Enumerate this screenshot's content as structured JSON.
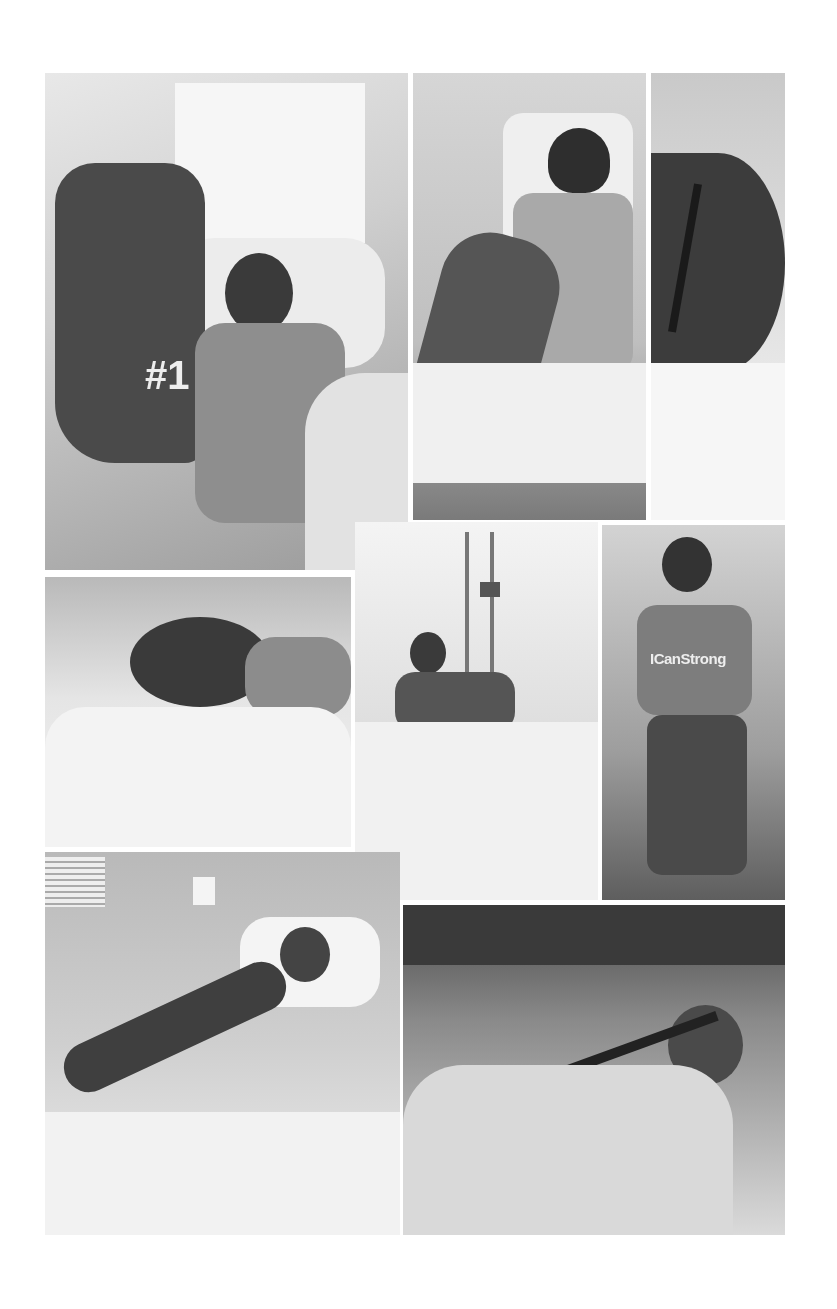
{
  "collage": {
    "description": "Grayscale collage of eight hospital photos",
    "panels": [
      {
        "id": "p1",
        "subject": "patient in hospital bed holding foam finger",
        "text": "#1"
      },
      {
        "id": "p2",
        "subject": "patient sitting in bed wearing helmet"
      },
      {
        "id": "p3",
        "subject": "close-up of head with surgical scar"
      },
      {
        "id": "p4",
        "subject": "patient lying with face on pillow"
      },
      {
        "id": "p5",
        "subject": "patient in hospital bed with IV poles"
      },
      {
        "id": "p6",
        "subject": "patient in wheelchair wearing helmet",
        "text": "ICanStrong"
      },
      {
        "id": "p7",
        "subject": "patient lying in hospital bed with bandaged head"
      },
      {
        "id": "p8",
        "subject": "patient in harness lift sling"
      }
    ]
  }
}
